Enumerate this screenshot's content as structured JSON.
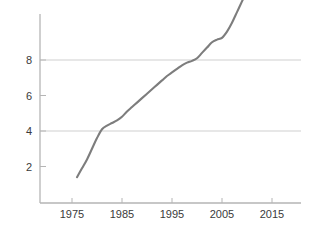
{
  "chart_data": {
    "type": "line",
    "title": "",
    "subtitle": "",
    "xlabel": "",
    "ylabel": "",
    "xlim": [
      1972,
      2018
    ],
    "ylim": [
      0,
      12.8
    ],
    "x_ticks": [
      1975,
      1985,
      1995,
      2005,
      2015
    ],
    "x_tick_labels": [
      "1975",
      "1985",
      "1995",
      "2005",
      "2015"
    ],
    "y_ticks": [
      2,
      4,
      6,
      8,
      12
    ],
    "y_tick_labels": [
      "2",
      "4",
      "6",
      "8",
      "12"
    ],
    "gridlines": {
      "horizontal_at": [
        4,
        8
      ],
      "vertical_at": [],
      "grid_color": "#cfcfcf"
    },
    "legend": {
      "entries": [],
      "position": "none"
    },
    "annotations": [],
    "axis_color": "#b5b5b5",
    "series": [
      {
        "name": "series-1",
        "color": "#7d7d7d",
        "line_width": 2.1,
        "x": [
          1976,
          1977,
          1978,
          1979,
          1980,
          1981,
          1982,
          1983,
          1984,
          1985,
          1986,
          1987,
          1988,
          1989,
          1990,
          1991,
          1992,
          1993,
          1994,
          1995,
          1996,
          1997,
          1998,
          1999,
          2000,
          2001,
          2002,
          2003,
          2004,
          2005,
          2006,
          2007,
          2008,
          2009,
          2010,
          2011
        ],
        "values": [
          1.4,
          1.9,
          2.4,
          3.0,
          3.6,
          4.1,
          4.3,
          4.45,
          4.6,
          4.8,
          5.1,
          5.35,
          5.6,
          5.85,
          6.1,
          6.35,
          6.6,
          6.85,
          7.1,
          7.3,
          7.5,
          7.7,
          7.85,
          7.95,
          8.1,
          8.4,
          8.7,
          9.0,
          9.15,
          9.25,
          9.6,
          10.1,
          10.7,
          11.3,
          11.9,
          12.4
        ]
      }
    ]
  },
  "caption": {
    "cut_off_text": ""
  }
}
